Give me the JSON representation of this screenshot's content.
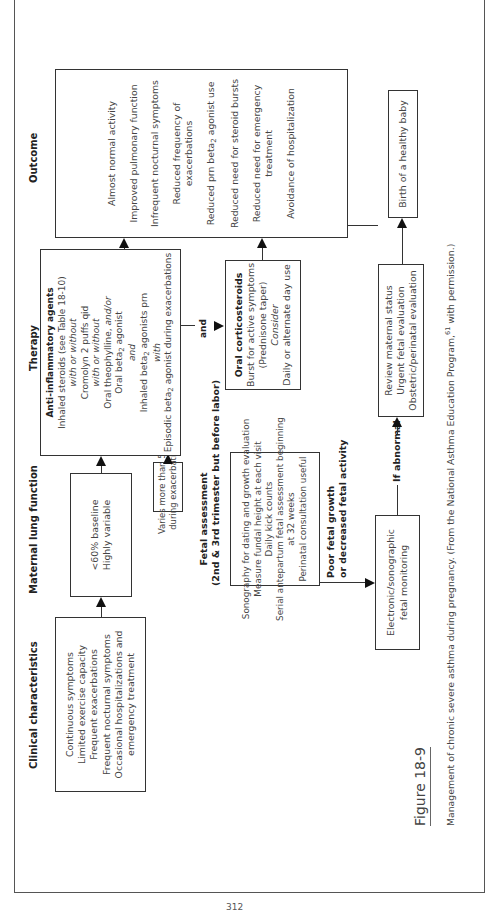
{
  "figure": {
    "label": "Figure 18-9",
    "caption": "Management of chronic severe asthma during pregnancy. (From the National Asthma Education Program,",
    "caption_ref": "61",
    "caption_end": " with permission.)"
  },
  "page_number": "312",
  "headers": {
    "clinical": "Clinical characteristics",
    "lung": "Maternal lung function",
    "therapy": "Therapy",
    "outcome": "Outcome"
  },
  "clinical_box": {
    "lines": [
      "Continuous symptoms",
      "Limited exercise capacity",
      "Frequent exacerbations",
      "Frequent nocturnal symptoms",
      "Occasional hospitalizations and",
      "emergency treatment"
    ]
  },
  "lung_box": {
    "lines": [
      "<60% baseline",
      "Highly variable"
    ]
  },
  "varies_box": {
    "lines": [
      "Varies more than 50%",
      "during exacerbation"
    ]
  },
  "therapy_box": {
    "title": "Anti-inflammatory agents",
    "line1": "Inhaled steroids (see Table 18-10)",
    "line2": "with or without",
    "line3": "Cromolyn 2 puffs qid",
    "line4": "with or without",
    "line5a": "Oral theophylline, ",
    "line5b": "and/or",
    "line6a": "Oral beta",
    "line6b": " agonist",
    "line7": "and",
    "line8a": "Inhaled beta",
    "line8b": " agonists prn",
    "line9": "with",
    "line10a": "Episodic beta",
    "line10b": " agonist during exacerbations",
    "sub": "2"
  },
  "and_label": "and",
  "oral_box": {
    "title": "Oral corticosteroids",
    "line1": "Burst for active symptoms",
    "line2": "(Prednisone taper)",
    "line3": "Consider",
    "line4": "Daily or alternate day use"
  },
  "outcome_box": {
    "items": [
      "Almost normal activity",
      "Improved pulmonary function",
      "Infrequent nocturnal symptoms",
      "Reduced frequency of",
      "exacerbations",
      "Reduced prn beta",
      " agonist use",
      "Reduced need for steroid bursts",
      "Reduced need for emergency",
      "treatment",
      "Avoidance of hospitalization"
    ],
    "sub": "2"
  },
  "fetal_section": {
    "title1": "Fetal assessment",
    "title2": "(2nd & 3rd trimester but before labor)",
    "lines": [
      "Sonography for dating and growth evaluation",
      "Measure fundal height at each visit",
      "Daily kick counts",
      "Serial antepartum fetal assessment beginning",
      "at 32 weeks",
      "Perinatal consultation useful"
    ]
  },
  "poor_growth_label": [
    "Poor fetal growth",
    "or decreased fetal activity"
  ],
  "electronic_box": {
    "lines": [
      "Electronic/sonographic",
      "fetal monitoring"
    ]
  },
  "if_abnormal_label": "If abnormal",
  "review_box": {
    "lines": [
      "Review maternal status",
      "Urgent fetal evaluation",
      "Obstetric/perinatal evaluation"
    ]
  },
  "birth_box": {
    "label": "Birth of a healthy baby"
  }
}
